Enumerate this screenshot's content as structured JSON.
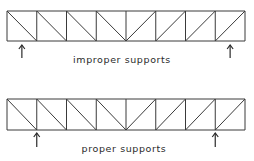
{
  "diagrams": [
    {
      "id": "improper",
      "caption": "improper supports",
      "panels": 8,
      "diagonals": [
        "down",
        "down",
        "down",
        "down",
        "up",
        "up",
        "up",
        "up"
      ],
      "supports": [
        {
          "position_panels": 0.5,
          "at_node": false
        },
        {
          "position_panels": 7.5,
          "at_node": false
        }
      ]
    },
    {
      "id": "proper",
      "caption": "proper supports",
      "panels": 8,
      "diagonals": [
        "down",
        "down",
        "down",
        "down",
        "up",
        "up",
        "up",
        "up"
      ],
      "supports": [
        {
          "position_panels": 1,
          "at_node": true
        },
        {
          "position_panels": 7,
          "at_node": true
        }
      ]
    }
  ]
}
